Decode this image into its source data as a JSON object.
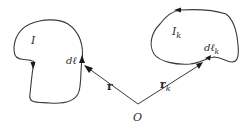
{
  "diagram": {
    "loop_left": {
      "current_label": "I",
      "element_label": "dℓ"
    },
    "loop_right": {
      "current_label": "I",
      "current_subscript": "k",
      "element_label": "dℓ",
      "element_subscript": "k"
    },
    "vector_left": {
      "label": "r"
    },
    "vector_right": {
      "label": "r",
      "subscript": "k"
    },
    "origin": {
      "label": "O"
    },
    "colors": {
      "stroke": "#3a3a3a",
      "text": "#2b2b2b",
      "background": "#ffffff"
    }
  }
}
